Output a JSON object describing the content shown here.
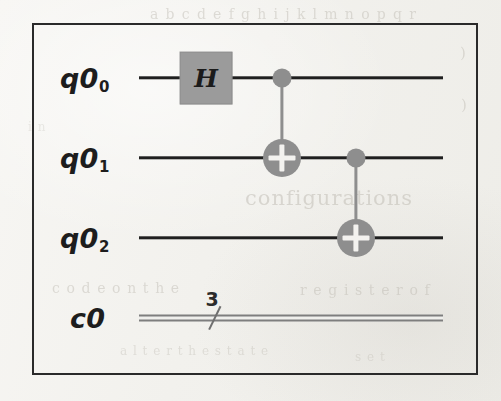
{
  "figure": {
    "kind": "quantum-circuit-diagram",
    "border_color": "#2a2a2a",
    "background_color": "#f4f3ef",
    "gate_fill_color": "#9b9b9b",
    "control_color": "#8e8e8e",
    "wire_color": "#1f1f1f",
    "classical_wire_color": "#7e7e7e"
  },
  "registers": [
    {
      "id": "q0_0",
      "label_main": "q0",
      "label_sub": "0",
      "type": "quantum",
      "y": 78,
      "label_x": 60,
      "wire_x1": 139,
      "wire_x2": 443
    },
    {
      "id": "q0_1",
      "label_main": "q0",
      "label_sub": "1",
      "type": "quantum",
      "y": 158,
      "label_x": 60,
      "wire_x1": 139,
      "wire_x2": 443
    },
    {
      "id": "q0_2",
      "label_main": "q0",
      "label_sub": "2",
      "type": "quantum",
      "y": 238,
      "label_x": 60,
      "wire_x1": 139,
      "wire_x2": 443
    },
    {
      "id": "c0",
      "label_main": "c0",
      "label_sub": "",
      "type": "classical",
      "y": 318,
      "label_x": 70,
      "wire_x1": 139,
      "wire_x2": 443
    }
  ],
  "classical_bus": {
    "width_label": "3",
    "slash_x": 215,
    "count_x": 212,
    "count_y": 309
  },
  "gates": [
    {
      "id": "h-gate",
      "name": "hadamard",
      "label": "H",
      "target_register": "q0_0",
      "x": 206,
      "y": 78,
      "width": 53,
      "height": 53
    }
  ],
  "cnots": [
    {
      "id": "cnot-0-1",
      "name": "cnot-q0-to-q1",
      "control_register": "q0_0",
      "target_register": "q0_1",
      "x": 282,
      "control_y": 78,
      "target_y": 158
    },
    {
      "id": "cnot-1-2",
      "name": "cnot-q1-to-q2",
      "control_register": "q0_1",
      "target_register": "q0_2",
      "x": 356,
      "control_y": 158,
      "target_y": 238
    }
  ],
  "bleed_through_text": {
    "line_1": "a b c d e f g h i j k l m n o p q r",
    "line_2": ")",
    "line_3": ")",
    "line_4": "configurations",
    "line_5": "c o d e   o n   t h e",
    "line_6": "r e g i s t e r   o f",
    "line_7": "a l t e r   t h e   s t a t e",
    "line_8": "s e t",
    "line_9": "i n"
  }
}
